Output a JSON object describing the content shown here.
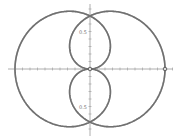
{
  "chart_data": {
    "type": "line",
    "title": "",
    "xlabel": "",
    "ylabel": "",
    "grid": false,
    "origin_px": [
      90,
      69
    ],
    "scale_px_per_unit": 75,
    "axis": {
      "x_range_px": [
        8,
        173
      ],
      "y_range_px": [
        4,
        136
      ],
      "tick_spacing_px": 7.5,
      "color": "#999999"
    },
    "tick_labels": [
      {
        "text": "0.5",
        "x": 0,
        "y": 0.5
      },
      {
        "text": "0.5",
        "x": 0,
        "y": -0.5
      }
    ],
    "series": [
      {
        "name": "curve-light",
        "equation": "r = -cos(θ/2)",
        "color": "#b8b8b8",
        "sign": -1,
        "stroke_width": 1.6
      },
      {
        "name": "curve-dark",
        "equation": "r = cos(θ/2)",
        "color": "#707070",
        "sign": 1,
        "stroke_width": 1.6
      }
    ],
    "points": [
      {
        "name": "origin-point",
        "x": 0,
        "y": 0
      },
      {
        "name": "right-intercept-point",
        "x": 1,
        "y": 0
      }
    ]
  }
}
